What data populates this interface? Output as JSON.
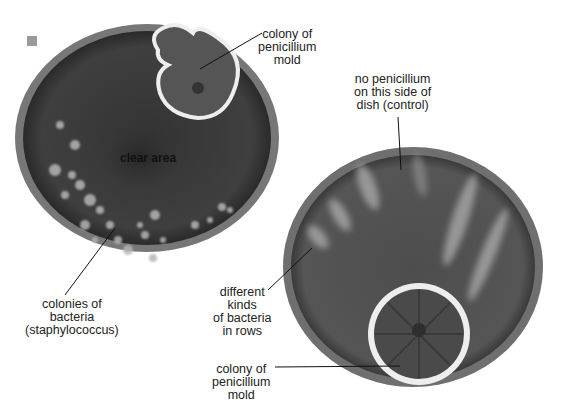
{
  "figure": {
    "marker_color": "#9a9a9a",
    "left_dish": {
      "center_label": "clear area",
      "labels": {
        "mold": "colony of\npenicillium\nmold",
        "bacteria": "colonies of\nbacteria\n(staphylococcus)"
      }
    },
    "right_dish": {
      "labels": {
        "control": "no penicillium\non this side of\ndish (control)",
        "rows": "different\nkinds\nof bacteria\nin rows",
        "mold": "colony of\npenicillium\nmold"
      }
    },
    "colors": {
      "agar_dark": "#3d3d3d",
      "agar_right": "#4a4a4a",
      "rim": "#8a8a8a",
      "colony_light": "#b8b8b8",
      "mold_edge": "#eeeeee"
    }
  }
}
